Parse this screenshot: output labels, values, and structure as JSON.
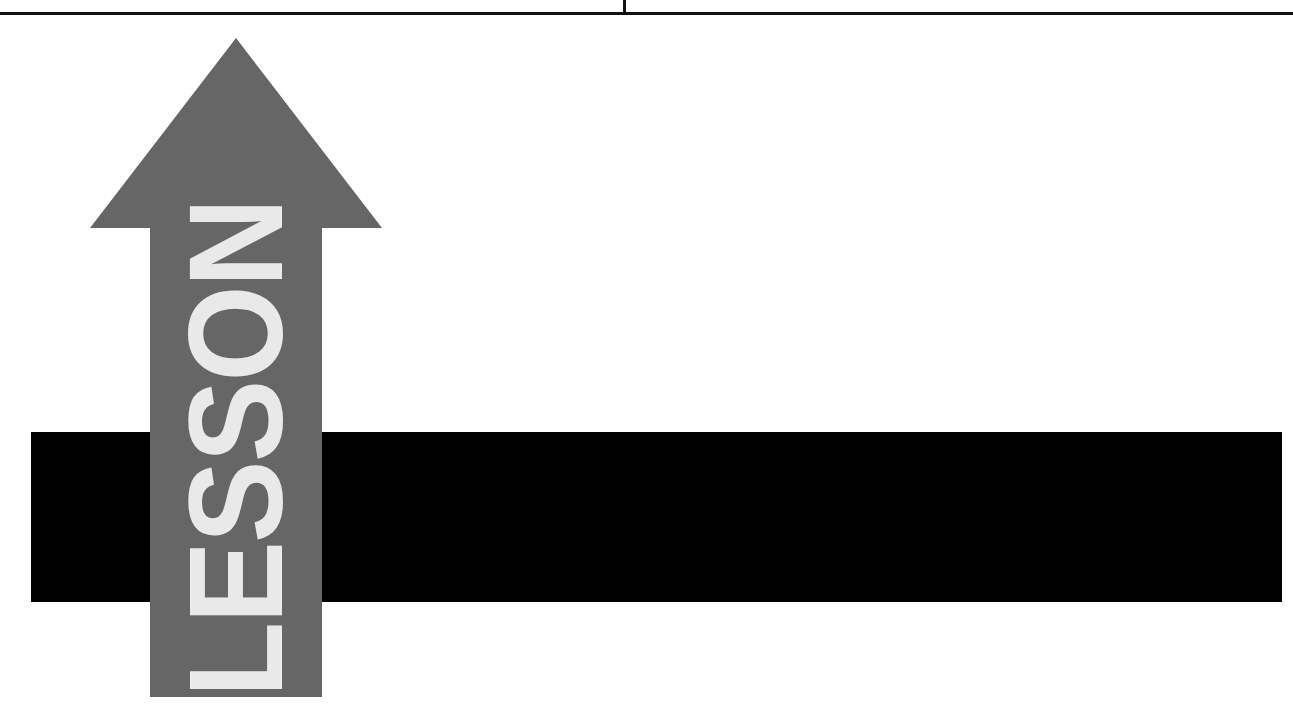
{
  "page": {
    "background_color": "#ffffff",
    "width": 1293,
    "height": 714
  },
  "header_rule": {
    "color": "#111111",
    "tick_x": 624
  },
  "banner": {
    "word": "LESSON",
    "word_color": "#e9e9e9",
    "arrow_color": "#666666",
    "arrow_direction": "up",
    "band_color": "#000000"
  },
  "chart_data": {
    "type": "diagram",
    "title": "LESSON",
    "shapes": [
      {
        "name": "top-rule",
        "kind": "line",
        "x1": 0,
        "y1": 14,
        "x2": 1293,
        "y2": 14,
        "color": "#111111"
      },
      {
        "name": "top-tick",
        "kind": "line",
        "x1": 624,
        "y1": 0,
        "x2": 624,
        "y2": 14,
        "color": "#111111"
      },
      {
        "name": "black-band",
        "kind": "rect",
        "x": 31,
        "y": 432,
        "width": 1251,
        "height": 170,
        "color": "#000000"
      },
      {
        "name": "up-arrow",
        "kind": "polygon",
        "points": "236,38 382,228 322,228 322,697 150,697 150,228 90,228",
        "color": "#666666",
        "label": "LESSON",
        "label_color": "#e9e9e9",
        "label_rotation_deg": -90
      }
    ]
  }
}
